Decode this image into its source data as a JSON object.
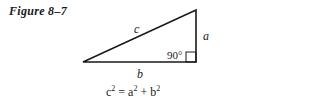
{
  "figure": {
    "caption": "Figure 8–7",
    "labels": {
      "hypotenuse": "c",
      "vertical_leg": "a",
      "horizontal_leg": "b",
      "right_angle": "90°"
    },
    "formula": {
      "c": "c",
      "eq": " = ",
      "a": "a",
      "plus": " + ",
      "b": "b",
      "exp": "2"
    },
    "colors": {
      "stroke": "#1a1a1a",
      "background": "#ffffff"
    }
  }
}
